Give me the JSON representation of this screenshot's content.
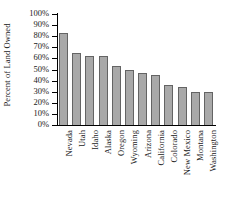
{
  "chart_data": {
    "type": "bar",
    "title": "",
    "xlabel": "",
    "ylabel": "Percent of Land Owned",
    "ylim": [
      0,
      100
    ],
    "ytick_labels": [
      "100%",
      "90%",
      "80%",
      "70%",
      "60%",
      "50%",
      "40%",
      "30%",
      "20%",
      "10%",
      "0%"
    ],
    "ytick_values": [
      100,
      90,
      80,
      70,
      60,
      50,
      40,
      30,
      20,
      10,
      0
    ],
    "grid": false,
    "legend": null,
    "categories": [
      "Nevada",
      "Utah",
      "Idaho",
      "Alaska",
      "Oregon",
      "Wyoming",
      "Arizona",
      "California",
      "Colorado",
      "New Mexico",
      "Montana",
      "Washington"
    ],
    "values": [
      83,
      65,
      62,
      62,
      53,
      50,
      47,
      45,
      36,
      34,
      30,
      30
    ],
    "bar_color": "#a9a9a9",
    "bar_edge_color": "#646464"
  }
}
